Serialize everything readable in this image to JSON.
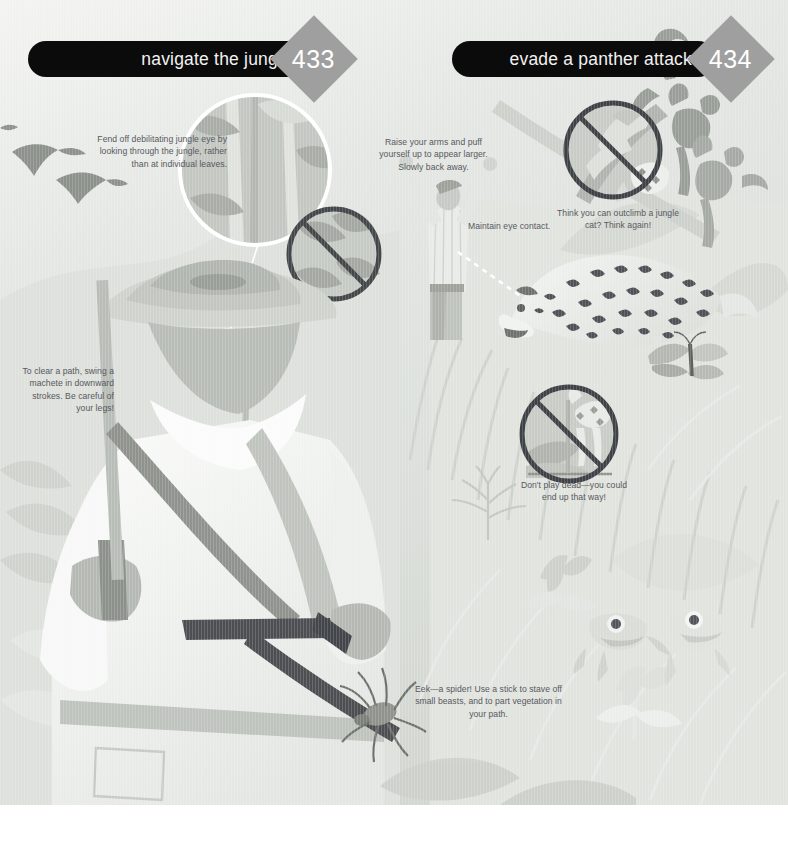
{
  "spread": {
    "left_page": {
      "banner_title": "navigate the jungle",
      "page_number": "433"
    },
    "right_page": {
      "banner_title": "evade a panther attack",
      "page_number": "434"
    }
  },
  "captions": [
    {
      "id": "jungle-eye",
      "text": "Fend off debilitating jungle eye by looking through the jungle, rather than at individual leaves.",
      "align": "right"
    },
    {
      "id": "raise-arms",
      "text": "Raise your arms and puff yourself up to appear larger. Slowly back away.",
      "align": "center"
    },
    {
      "id": "eye-contact",
      "text": "Maintain eye contact.",
      "align": "left"
    },
    {
      "id": "outclimb",
      "text": "Think you can outclimb a jungle cat? Think again!",
      "align": "center"
    },
    {
      "id": "machete",
      "text": "To clear a path, swing a machete in downward strokes. Be careful of your legs!",
      "align": "right"
    },
    {
      "id": "play-dead",
      "text": "Don't play dead—you could end up that way!",
      "align": "center"
    },
    {
      "id": "spider",
      "text": "Eek—a spider! Use a stick to stave off small beasts, and to part vegetation in your path.",
      "align": "center"
    }
  ],
  "icons": [
    {
      "id": "no-individual-leaves",
      "name": "prohibition-leaves-icon",
      "meaning": "do not stare at individual leaves"
    },
    {
      "id": "no-climbing-tree",
      "name": "prohibition-climb-tree-icon",
      "meaning": "do not try to outclimb a jungle cat"
    },
    {
      "id": "no-playing-dead",
      "name": "prohibition-play-dead-icon",
      "meaning": "do not play dead"
    }
  ],
  "illustration": {
    "description": "Monochrome jungle scene: explorer in hat with backpack holding a machete, magnifier circle on foliage, birds, monkeys on a vine, spotted panther, butterfly, tree frogs, flowers and tall grass.",
    "elements": [
      "explorer-figure",
      "machete",
      "pith-hat",
      "backpack",
      "magnifier-circle",
      "birds",
      "monkeys",
      "panther",
      "butterfly",
      "tree-frogs",
      "flowers",
      "spider",
      "grass"
    ]
  },
  "colors": {
    "banner_background": "#0b0b0b",
    "banner_text": "#f2f2f2",
    "page_diamond": "#9f9f9f",
    "page_number_text": "#ffffff",
    "caption_text": "#58585e",
    "paper_background": "#ffffff",
    "art_light": "#e9ebe8",
    "art_mid": "#c9ccc6",
    "art_dark": "#9ea29b",
    "art_darkest": "#6e726c"
  }
}
